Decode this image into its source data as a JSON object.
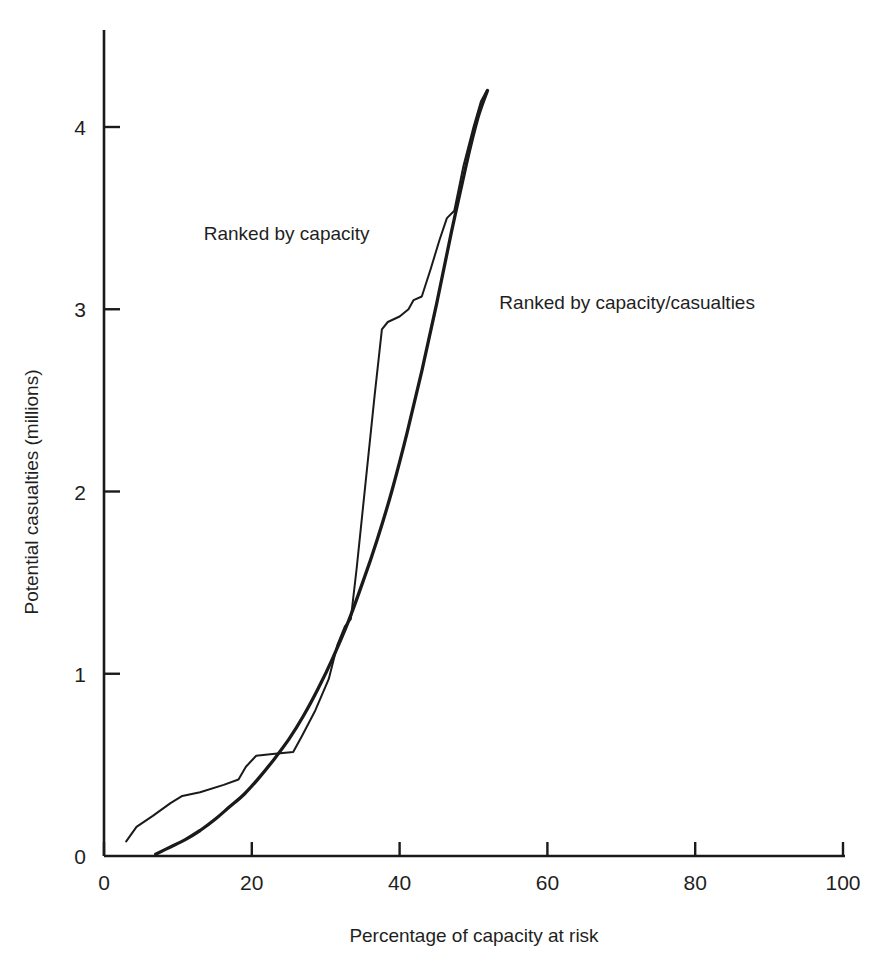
{
  "figure": {
    "top_fragment_text": "",
    "background_color": "#ffffff",
    "ink_color": "#1a1a1a"
  },
  "chart_data": {
    "type": "line",
    "title": "",
    "xlabel": "Percentage of capacity at risk",
    "ylabel": "Potential casualties (millions)",
    "xlim": [
      0,
      100
    ],
    "ylim": [
      0,
      4.4
    ],
    "xticks": [
      0,
      20,
      40,
      60,
      80,
      100
    ],
    "xtick_labels": [
      "0",
      "20",
      "40",
      "60",
      "80",
      "100"
    ],
    "yticks": [
      0,
      1,
      2,
      3,
      4
    ],
    "ytick_labels": [
      "0",
      "1",
      "2",
      "3",
      "4"
    ],
    "grid": false,
    "legend_position": "inline-annotations",
    "annotations": [
      {
        "text": "Ranked by capacity",
        "x_data": 13.5,
        "y_data": 3.38,
        "anchor": "start"
      },
      {
        "text": "Ranked by capacity/casualties",
        "x_data": 53.5,
        "y_data": 3.0,
        "anchor": "start"
      }
    ],
    "series": [
      {
        "name": "Ranked by capacity",
        "label": "Ranked by capacity",
        "stroke_width": 2.0,
        "points": [
          [
            3.0,
            0.08
          ],
          [
            4.4,
            0.16
          ],
          [
            6.6,
            0.22
          ],
          [
            9.0,
            0.29
          ],
          [
            10.6,
            0.33
          ],
          [
            13.0,
            0.35
          ],
          [
            16.2,
            0.39
          ],
          [
            18.2,
            0.42
          ],
          [
            19.2,
            0.49
          ],
          [
            20.6,
            0.55
          ],
          [
            22.8,
            0.56
          ],
          [
            25.6,
            0.57
          ],
          [
            26.8,
            0.66
          ],
          [
            28.6,
            0.8
          ],
          [
            30.4,
            0.97
          ],
          [
            31.6,
            1.16
          ],
          [
            32.6,
            1.26
          ],
          [
            33.4,
            1.3
          ],
          [
            34.2,
            1.58
          ],
          [
            35.4,
            2.05
          ],
          [
            36.6,
            2.52
          ],
          [
            37.6,
            2.89
          ],
          [
            38.4,
            2.93
          ],
          [
            40.0,
            2.96
          ],
          [
            41.2,
            3.0
          ],
          [
            41.9,
            3.05
          ],
          [
            43.0,
            3.07
          ],
          [
            44.2,
            3.22
          ],
          [
            45.4,
            3.38
          ],
          [
            46.4,
            3.5
          ],
          [
            47.4,
            3.54
          ],
          [
            48.6,
            3.78
          ],
          [
            50.0,
            4.0
          ],
          [
            51.0,
            4.14
          ],
          [
            51.8,
            4.2
          ]
        ]
      },
      {
        "name": "Ranked by capacity/casualties",
        "label": "Ranked by capacity/casualties",
        "stroke_width": 3.3,
        "points": [
          [
            7.0,
            0.01
          ],
          [
            9.0,
            0.05
          ],
          [
            11.0,
            0.09
          ],
          [
            13.0,
            0.14
          ],
          [
            15.0,
            0.2
          ],
          [
            17.0,
            0.27
          ],
          [
            19.0,
            0.34
          ],
          [
            21.0,
            0.43
          ],
          [
            23.0,
            0.53
          ],
          [
            25.0,
            0.64
          ],
          [
            27.0,
            0.77
          ],
          [
            29.0,
            0.92
          ],
          [
            31.0,
            1.09
          ],
          [
            33.0,
            1.28
          ],
          [
            35.0,
            1.5
          ],
          [
            37.0,
            1.74
          ],
          [
            39.0,
            2.01
          ],
          [
            41.0,
            2.32
          ],
          [
            43.0,
            2.66
          ],
          [
            45.0,
            3.03
          ],
          [
            47.0,
            3.42
          ],
          [
            49.0,
            3.79
          ],
          [
            50.6,
            4.05
          ],
          [
            51.9,
            4.2
          ]
        ]
      }
    ]
  }
}
